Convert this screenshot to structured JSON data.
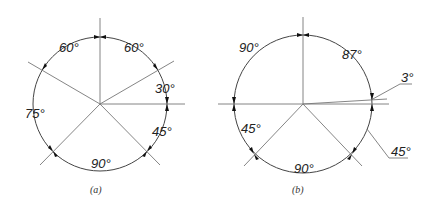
{
  "figure_a": {
    "caption": "(a)",
    "angles": [
      "60°",
      "60°",
      "30°",
      "45°",
      "90°",
      "75°"
    ]
  },
  "figure_b": {
    "caption": "(b)",
    "angles": [
      "90°",
      "87°",
      "3°",
      "45°",
      "90°",
      "45°"
    ]
  }
}
